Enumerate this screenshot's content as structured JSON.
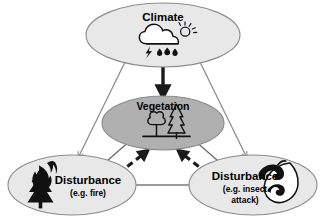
{
  "diagram": {
    "background_color": "#ffffff",
    "nodes": {
      "climate": {
        "label": "Climate",
        "icon": "cloud-sun-rain-lightning-icon",
        "fill_color": "#e8e8e8",
        "stroke_color": "#8a8a8a"
      },
      "vegetation": {
        "label": "Vegetation",
        "icon": "trees-icon",
        "fill_color": "#b0b0b0",
        "stroke_color": "#8a8a8a"
      },
      "disturbance_fire": {
        "label": "Disturbance",
        "sublabel": "(e.g. fire)",
        "icon": "burning-tree-icon",
        "fill_color": "#e8e8e8",
        "stroke_color": "#8a8a8a"
      },
      "disturbance_insect": {
        "label": "Disturbance",
        "sublabel_line1": "(e.g. insect",
        "sublabel_line2": "attack)",
        "icon": "insect-on-leaf-icon",
        "fill_color": "#e8e8e8",
        "stroke_color": "#8a8a8a"
      }
    },
    "edges": [
      {
        "id": "climate-to-vegetation",
        "from": "climate",
        "to": "vegetation",
        "style": "solid",
        "weight": "thick",
        "color": "#1a1a1a",
        "arrowheads": "single"
      },
      {
        "id": "climate-to-disturbance-fire",
        "from": "climate",
        "to": "disturbance_fire",
        "style": "solid",
        "weight": "thin",
        "color": "#8a8a8a",
        "arrowheads": "single"
      },
      {
        "id": "climate-to-disturbance-insect",
        "from": "climate",
        "to": "disturbance_insect",
        "style": "solid",
        "weight": "thin",
        "color": "#8a8a8a",
        "arrowheads": "single"
      },
      {
        "id": "vegetation-to-disturbance-fire",
        "from": "vegetation",
        "to": "disturbance_fire",
        "style": "solid",
        "weight": "thin",
        "color": "#6e6e6e",
        "arrowheads": "single"
      },
      {
        "id": "vegetation-to-disturbance-insect",
        "from": "vegetation",
        "to": "disturbance_insect",
        "style": "solid",
        "weight": "thin",
        "color": "#6e6e6e",
        "arrowheads": "single"
      },
      {
        "id": "disturbance-fire-to-vegetation",
        "from": "disturbance_fire",
        "to": "vegetation",
        "style": "dashed",
        "weight": "thick",
        "color": "#1a1a1a",
        "arrowheads": "single"
      },
      {
        "id": "disturbance-insect-to-vegetation",
        "from": "disturbance_insect",
        "to": "vegetation",
        "style": "dashed",
        "weight": "thick",
        "color": "#1a1a1a",
        "arrowheads": "single"
      },
      {
        "id": "disturbance-fire-insect-link",
        "from": "disturbance_fire",
        "to": "disturbance_insect",
        "style": "solid",
        "weight": "thin",
        "color": "#7a7a7a",
        "arrowheads": "double"
      }
    ]
  }
}
